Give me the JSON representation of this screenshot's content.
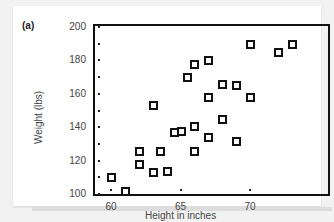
{
  "panel_label": "(a)",
  "chart_data": {
    "type": "scatter",
    "title": "",
    "xlabel": "Height in inches",
    "ylabel": "Weight (lbs)",
    "xlim": [
      59,
      74
    ],
    "ylim": [
      95,
      202
    ],
    "x_ticks": [
      60,
      65,
      70
    ],
    "y_ticks": [
      100,
      120,
      140,
      160,
      180,
      200
    ],
    "grid": false,
    "legend": null,
    "marker": "hollow-square",
    "points": [
      {
        "x": 60,
        "y": 110
      },
      {
        "x": 61,
        "y": 102
      },
      {
        "x": 62,
        "y": 126
      },
      {
        "x": 62,
        "y": 118
      },
      {
        "x": 63,
        "y": 113
      },
      {
        "x": 63,
        "y": 153
      },
      {
        "x": 63.5,
        "y": 126
      },
      {
        "x": 64,
        "y": 114
      },
      {
        "x": 64.5,
        "y": 137
      },
      {
        "x": 65,
        "y": 138
      },
      {
        "x": 65.5,
        "y": 170
      },
      {
        "x": 66,
        "y": 178
      },
      {
        "x": 66,
        "y": 141
      },
      {
        "x": 66,
        "y": 126
      },
      {
        "x": 67,
        "y": 180
      },
      {
        "x": 67,
        "y": 158
      },
      {
        "x": 67,
        "y": 134
      },
      {
        "x": 68,
        "y": 166
      },
      {
        "x": 68,
        "y": 145
      },
      {
        "x": 69,
        "y": 165
      },
      {
        "x": 69,
        "y": 132
      },
      {
        "x": 70,
        "y": 190
      },
      {
        "x": 70,
        "y": 158
      },
      {
        "x": 72,
        "y": 185
      },
      {
        "x": 73,
        "y": 190
      }
    ],
    "marginal_dots": {
      "y_axis": [
        100,
        110,
        120,
        130,
        140,
        150,
        160,
        170,
        180,
        190,
        200
      ],
      "x_axis": [
        60,
        65,
        70
      ]
    }
  }
}
